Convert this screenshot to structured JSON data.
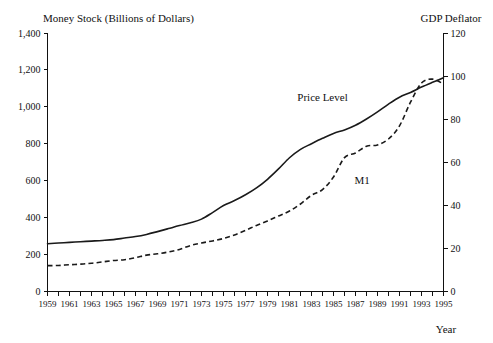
{
  "chart_data": {
    "type": "line",
    "title": "",
    "left_axis_title": "Money Stock (Billions of Dollars)",
    "right_axis_title": "GDP Deflator",
    "xlabel": "Year",
    "ylabel": "Money Stock (Billions of Dollars)",
    "y2label": "GDP Deflator",
    "grid": false,
    "legend_position": "inline-annotation",
    "xlim": [
      1959,
      1995
    ],
    "ylim": [
      0,
      1400
    ],
    "y2lim": [
      0,
      120
    ],
    "y_ticks": [
      "0",
      "200",
      "400",
      "600",
      "800",
      "1,000",
      "1,200",
      "1,400"
    ],
    "y_tick_values": [
      0,
      200,
      400,
      600,
      800,
      1000,
      1200,
      1400
    ],
    "y2_ticks": [
      "0",
      "20",
      "40",
      "60",
      "80",
      "100",
      "120"
    ],
    "y2_tick_values": [
      0,
      20,
      40,
      60,
      80,
      100,
      120
    ],
    "x_tick_values": [
      1959,
      1960,
      1961,
      1962,
      1963,
      1964,
      1965,
      1966,
      1967,
      1968,
      1969,
      1970,
      1971,
      1972,
      1973,
      1974,
      1975,
      1976,
      1977,
      1978,
      1979,
      1980,
      1981,
      1982,
      1983,
      1984,
      1985,
      1986,
      1987,
      1988,
      1989,
      1990,
      1991,
      1992,
      1993,
      1994,
      1995
    ],
    "x_tick_labels": [
      "1959",
      "1961",
      "1963",
      "1965",
      "1967",
      "1969",
      "1971",
      "1973",
      "1975",
      "1977",
      "1979",
      "1981",
      "1983",
      "1985",
      "1987",
      "1989",
      "1991",
      "1993",
      "1995"
    ],
    "x_tick_label_values": [
      1959,
      1961,
      1963,
      1965,
      1967,
      1969,
      1971,
      1973,
      1975,
      1977,
      1979,
      1981,
      1983,
      1985,
      1987,
      1989,
      1991,
      1993,
      1995
    ],
    "x": [
      1959,
      1960,
      1961,
      1962,
      1963,
      1964,
      1965,
      1966,
      1967,
      1968,
      1969,
      1970,
      1971,
      1972,
      1973,
      1974,
      1975,
      1976,
      1977,
      1978,
      1979,
      1980,
      1981,
      1982,
      1983,
      1984,
      1985,
      1986,
      1987,
      1988,
      1989,
      1990,
      1991,
      1992,
      1993,
      1994,
      1995
    ],
    "series": [
      {
        "name": "Price Level",
        "axis": "right",
        "style": "solid",
        "label": "Price Level",
        "label_x": 1984.0,
        "label_y": 88.5,
        "values": [
          22.2,
          22.5,
          22.8,
          23.1,
          23.4,
          23.7,
          24.1,
          24.8,
          25.5,
          26.5,
          27.8,
          29.2,
          30.6,
          31.9,
          33.6,
          36.6,
          39.9,
          42.2,
          44.9,
          48.1,
          52.1,
          56.9,
          62.1,
          66.0,
          68.6,
          71.1,
          73.4,
          75.0,
          77.2,
          80.1,
          83.4,
          87.0,
          90.2,
          92.4,
          94.9,
          97.1,
          99.2
        ]
      },
      {
        "name": "M1",
        "axis": "left",
        "style": "dashed",
        "label": "M1",
        "label_x": 1987.6,
        "label_y": 583,
        "values": [
          140,
          141,
          145,
          148,
          153,
          160,
          168,
          172,
          183,
          197,
          204,
          214,
          228,
          249,
          263,
          274,
          287,
          306,
          331,
          358,
          382,
          409,
          436,
          474,
          521,
          552,
          620,
          725,
          750,
          787,
          794,
          826,
          897,
          1025,
          1129,
          1150,
          1124
        ]
      }
    ],
    "annotations": [
      {
        "text": "Price Level",
        "series": "Price Level"
      },
      {
        "text": "M1",
        "series": "M1"
      }
    ]
  },
  "figure": {
    "left_axis_title": "Money Stock (Billions of Dollars)",
    "right_axis_title": "GDP Deflator",
    "x_axis_title": "Year"
  }
}
